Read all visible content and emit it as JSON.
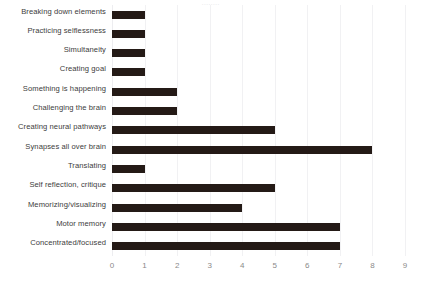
{
  "chart_data": {
    "type": "bar",
    "orientation": "horizontal",
    "title": "",
    "xlabel": "",
    "ylabel": "",
    "xlim": [
      0,
      9
    ],
    "xticks": [
      "0",
      "1",
      "2",
      "3",
      "4",
      "5",
      "6",
      "7",
      "8",
      "9"
    ],
    "grid": true,
    "legend": false,
    "bar_color": "#241a16",
    "gridline_color": "#f1f1f3",
    "label_color": "#3c3c3c",
    "tick_color": "#8a8a8a",
    "background_color": "#ffffff",
    "categories": [
      "Breaking down elements",
      "Practicing selflessness",
      "Simultaneity",
      "Creating goal",
      "Something is happening",
      "Challenging the brain",
      "Creating neural pathways",
      "Synapses all over brain",
      "Translating",
      "Self reflection, critique",
      "Memorizing/visualizing",
      "Motor memory",
      "Concentrated/focused"
    ],
    "values": [
      1,
      1,
      1,
      1,
      2,
      2,
      5,
      8,
      1,
      5,
      4,
      7,
      7
    ]
  },
  "title_ghost": "........"
}
